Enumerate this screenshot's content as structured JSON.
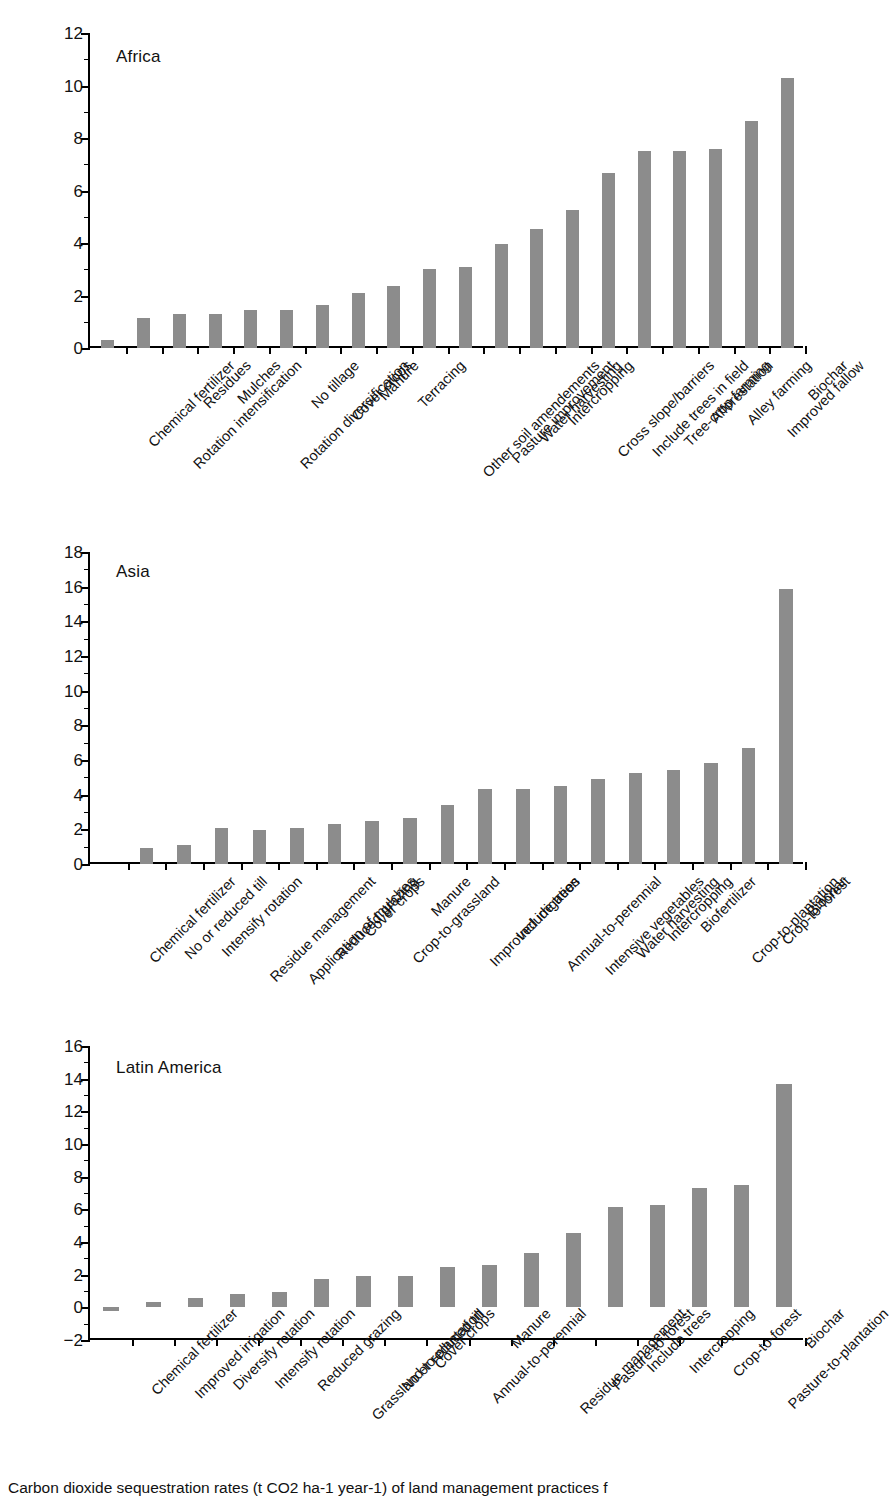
{
  "figure": {
    "caption": "Carbon dioxide sequestration rates (t CO2 ha-1 year-1) of land management practices f"
  },
  "chart_data": [
    {
      "type": "bar",
      "title": "Africa",
      "xlabel": "",
      "ylabel": "",
      "ylim": [
        0,
        12
      ],
      "yticks": [
        0,
        2,
        4,
        6,
        8,
        10,
        12
      ],
      "grid": false,
      "legend": "none",
      "categories": [
        "Chemical fertilizer",
        "Rotation intensification",
        "Residues",
        "Mulches",
        "Rotation diversification",
        "No tillage",
        "Cover crops",
        "Manure",
        "Terracing",
        "Other soil amendements",
        "Pasture improvement",
        "Water harvesting",
        "Intercropping",
        "Cross slope/barriers",
        "Include trees in field",
        "Tree-crop farming",
        "Afforestation",
        "Alley farming",
        "Improved fallow",
        "Biochar"
      ],
      "values": [
        0.3,
        1.15,
        1.28,
        1.28,
        1.45,
        1.45,
        1.62,
        2.1,
        2.35,
        3.0,
        3.1,
        3.95,
        4.55,
        5.25,
        6.65,
        7.5,
        7.5,
        7.6,
        8.65,
        10.3
      ]
    },
    {
      "type": "bar",
      "title": "Asia",
      "xlabel": "",
      "ylabel": "",
      "ylim": [
        0,
        18
      ],
      "yticks": [
        0,
        2,
        4,
        6,
        8,
        10,
        12,
        14,
        16,
        18
      ],
      "grid": false,
      "legend": "none",
      "categories": [
        "Chemical fertilizer",
        "No or reduced till",
        "Intensify rotation",
        "Residue management",
        "Application of mulches",
        "Reduced grazing",
        "Cover crops",
        "Crop-to-grassland",
        "Manure",
        "Improved irrigation",
        "Include trees",
        "Annual-to-perennial",
        "Intensive vegetables",
        "Water harvesting",
        "Intercropping",
        "Biofertilizer",
        "Crop-to-plantation",
        "Crop-to-forest",
        "Biochar"
      ],
      "values": [
        0.0,
        0.92,
        1.1,
        2.05,
        1.95,
        2.1,
        2.3,
        2.5,
        2.65,
        3.4,
        4.3,
        4.3,
        4.5,
        4.9,
        5.25,
        5.4,
        5.8,
        6.7,
        15.85
      ]
    },
    {
      "type": "bar",
      "title": "Latin America",
      "xlabel": "",
      "ylabel": "",
      "ylim": [
        -2,
        16
      ],
      "yticks": [
        -2,
        0,
        2,
        4,
        6,
        8,
        10,
        12,
        14,
        16
      ],
      "grid": false,
      "legend": "none",
      "categories": [
        "Chemical fertilizer",
        "Improved irrigation",
        "Diversify rotation",
        "Intensify rotation",
        "Reduced grazing",
        "Grassland-to-plantation",
        "No or reduced till",
        "Cover crops",
        "Annual-to-perennial",
        "Manure",
        "Residue management",
        "Pasture-to-forest",
        "Include trees",
        "Intercropping",
        "Crop-to-forest",
        "Pasture-to-plantation",
        "Biochar"
      ],
      "values": [
        -0.2,
        0.3,
        0.55,
        0.8,
        0.92,
        1.75,
        1.9,
        1.9,
        2.5,
        2.6,
        3.35,
        4.55,
        6.15,
        6.25,
        7.3,
        7.5,
        13.65
      ]
    }
  ],
  "style": {
    "bar_color": "#8c8c8c",
    "axis_color": "#000000",
    "text_color": "#111111",
    "background": "#ffffff"
  }
}
